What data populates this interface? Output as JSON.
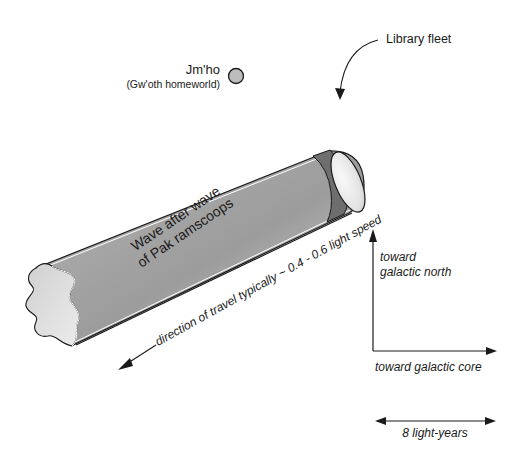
{
  "labels": {
    "planet_name": "Jm'ho",
    "planet_subtitle": "(Gw'oth homeworld)",
    "fleet_label": "Library fleet",
    "wave_line1": "Wave after wave",
    "wave_line2": "of Pak ramscoops",
    "direction": "direction of travel typically ~ 0.4 - 0.6 light speed",
    "north_line1": "toward",
    "north_line2": "galactic north",
    "core": "toward galactic core",
    "scale": "8 light-years"
  },
  "colors": {
    "tube_light": "#e6e6e6",
    "tube_dark": "#9a9a9a",
    "band": "#6e6e6e",
    "planet": "#bdbdbd",
    "stroke": "#1a1a1a"
  }
}
